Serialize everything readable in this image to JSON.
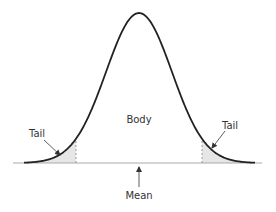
{
  "diagram": {
    "labels": {
      "body": "Body",
      "left_tail": "Tail",
      "right_tail": "Tail",
      "mean": "Mean"
    },
    "colors": {
      "curve": "#222222",
      "axis": "#aaaaaa",
      "tail_fill": "#e6e6e6",
      "dashed": "#888888",
      "arrow": "#333333",
      "text": "#333333"
    },
    "geometry": {
      "mean_x": 139,
      "peak_y": 13,
      "baseline_y": 163,
      "sigma_px": 33,
      "curve_x_range": [
        24,
        255
      ],
      "axis_x_range": [
        13,
        262
      ],
      "left_cutoff_x": 76,
      "right_cutoff_x": 202
    }
  }
}
